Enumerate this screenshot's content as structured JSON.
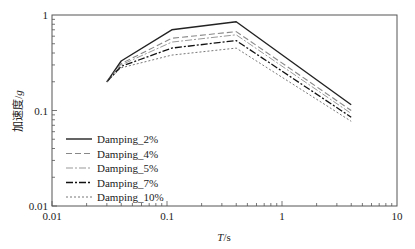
{
  "chart_data": {
    "type": "line",
    "title": "",
    "xlabel": "T/s",
    "ylabel": "加速度/g",
    "xscale": "log",
    "yscale": "log",
    "xlim": [
      0.01,
      10
    ],
    "ylim": [
      0.01,
      1
    ],
    "x_ticks": [
      "0.01",
      "0.1",
      "1",
      "10"
    ],
    "y_ticks": [
      "0.01",
      "0.1",
      "1"
    ],
    "grid": false,
    "legend_position": "lower left",
    "series": [
      {
        "name": "Damping_2%",
        "style": "solid",
        "color": "#222222",
        "width": 1.4,
        "x": [
          0.03,
          0.04,
          0.11,
          0.4,
          4
        ],
        "y": [
          0.2,
          0.33,
          0.7,
          0.85,
          0.115
        ]
      },
      {
        "name": "Damping_4%",
        "style": "dashed",
        "color": "#888888",
        "width": 1.1,
        "x": [
          0.03,
          0.04,
          0.11,
          0.4,
          4
        ],
        "y": [
          0.2,
          0.31,
          0.57,
          0.67,
          0.1
        ]
      },
      {
        "name": "Damping_5%",
        "style": "dashdot",
        "color": "#999999",
        "width": 1.0,
        "x": [
          0.03,
          0.04,
          0.11,
          0.4,
          4
        ],
        "y": [
          0.2,
          0.3,
          0.52,
          0.62,
          0.093
        ]
      },
      {
        "name": "Damping_7%",
        "style": "dashdot",
        "color": "#111111",
        "width": 1.3,
        "x": [
          0.03,
          0.04,
          0.11,
          0.4,
          4
        ],
        "y": [
          0.2,
          0.29,
          0.45,
          0.54,
          0.085
        ]
      },
      {
        "name": "Damping_10%",
        "style": "dotted",
        "color": "#777777",
        "width": 1.0,
        "x": [
          0.03,
          0.04,
          0.11,
          0.4,
          4
        ],
        "y": [
          0.2,
          0.28,
          0.38,
          0.45,
          0.077
        ]
      }
    ]
  },
  "labels": {
    "x_axis_title_italic": "T",
    "x_axis_title_unit": "/s",
    "y_axis_title_main": "加速度/",
    "y_axis_title_italic": "g"
  }
}
